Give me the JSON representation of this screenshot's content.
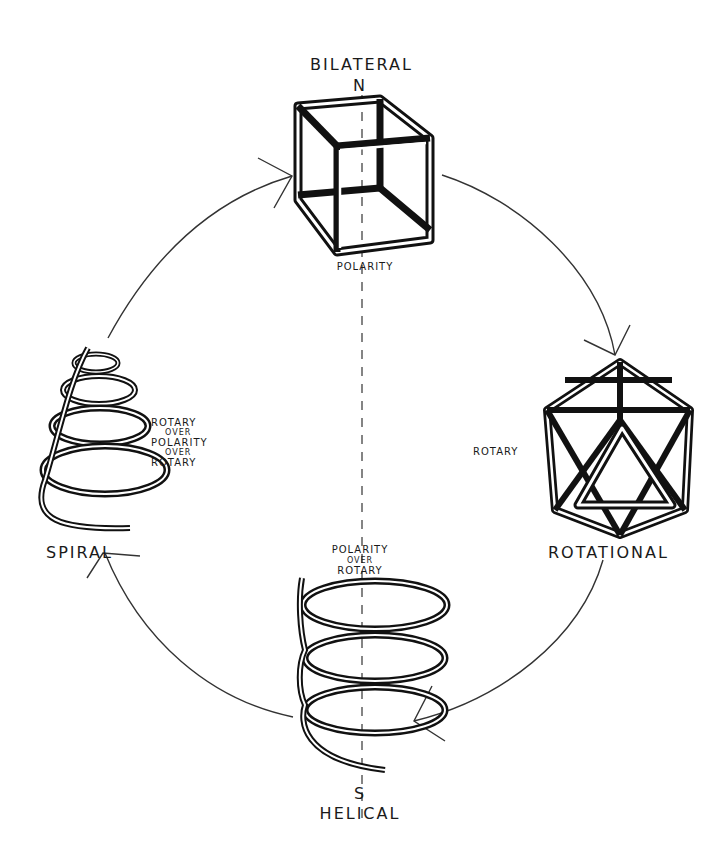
{
  "diagram": {
    "nodes": [
      {
        "id": "bilateral",
        "title": "BILATERAL",
        "pole": "N",
        "caption": "POLARITY",
        "shape": "cube"
      },
      {
        "id": "rotational",
        "title": "ROTATIONAL",
        "caption": "ROTARY",
        "shape": "icosahedron"
      },
      {
        "id": "helical",
        "title": "HELICAL",
        "pole": "S",
        "caption_lines": [
          "POLARITY",
          "OVER",
          "ROTARY"
        ],
        "shape": "helix"
      },
      {
        "id": "spiral",
        "title": "SPIRAL",
        "caption_lines": [
          "ROTARY",
          "OVER",
          "POLARITY",
          "OVER",
          "ROTARY"
        ],
        "shape": "conical-spiral"
      }
    ],
    "cycle": [
      "spiral",
      "bilateral",
      "rotational",
      "helical",
      "spiral"
    ],
    "axis": "dashed vertical N-S axis",
    "colors": {
      "ink": "#1a1a1a",
      "background": "#ffffff",
      "axis": "#666666"
    }
  }
}
